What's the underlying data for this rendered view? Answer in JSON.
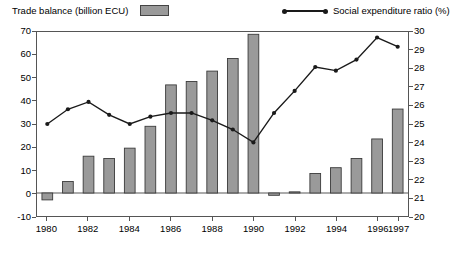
{
  "legend": {
    "bar_label": "Trade balance (billion ECU)",
    "line_label": "Social expenditure ratio (%)",
    "bar_swatch_color": "#9a9a9a",
    "line_color": "#1a1a1a"
  },
  "chart_data": {
    "type": "bar",
    "title": "",
    "xlabel": "",
    "ylabel": "",
    "grid": false,
    "legend_position": "top",
    "categories": [
      "1980",
      "1981",
      "1982",
      "1983",
      "1984",
      "1985",
      "1986",
      "1987",
      "1988",
      "1989",
      "1990",
      "1991",
      "1992",
      "1993",
      "1994",
      "1995",
      "1996",
      "1997"
    ],
    "xtick_labels": [
      "1980",
      "1982",
      "1984",
      "1986",
      "1988",
      "1990",
      "1992",
      "1994",
      "1996",
      "1997"
    ],
    "left_axis": {
      "label": "Trade balance (billion ECU)",
      "ylim": [
        -10,
        70
      ],
      "ticks": [
        70,
        60,
        50,
        40,
        30,
        20,
        10,
        0,
        -10
      ]
    },
    "right_axis": {
      "label": "Social expenditure ratio (%)",
      "ylim": [
        20,
        30
      ],
      "ticks": [
        30,
        29,
        28,
        27,
        26,
        25,
        24,
        23,
        22,
        21,
        20
      ]
    },
    "series": [
      {
        "name": "Trade balance (billion ECU)",
        "type": "bar",
        "axis": "left",
        "color": "#9a9a9a",
        "values": [
          -3,
          5,
          16,
          15,
          19.5,
          29,
          47,
          48.5,
          53,
          58.5,
          69,
          -1,
          0.5,
          8.5,
          11,
          15,
          23.5,
          36.5
        ]
      },
      {
        "name": "Social expenditure ratio (%)",
        "type": "line",
        "axis": "right",
        "color": "#1a1a1a",
        "values": [
          25.0,
          25.8,
          26.2,
          25.5,
          25.0,
          25.4,
          25.6,
          25.6,
          25.2,
          24.7,
          24.0,
          25.6,
          26.8,
          28.1,
          27.9,
          28.5,
          29.7,
          29.2
        ]
      }
    ]
  }
}
